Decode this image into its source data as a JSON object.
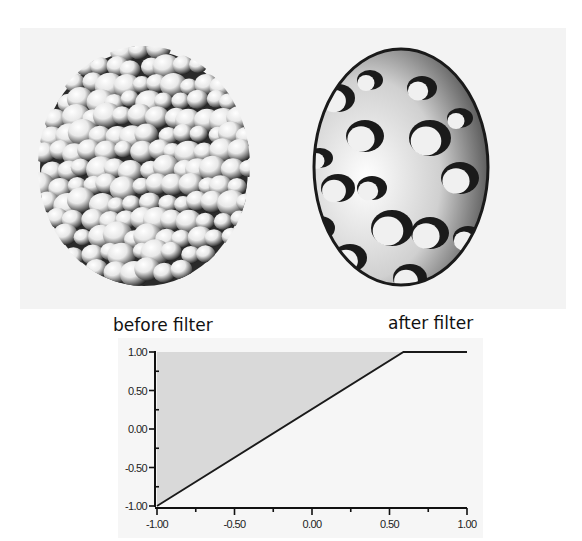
{
  "figure": {
    "left_render": {
      "name": "before-filter-render",
      "description": "clustered blob sphere"
    },
    "right_render": {
      "name": "after-filter-render",
      "description": "smooth cut sphere with blob holes"
    },
    "labels": {
      "before": "before filter",
      "after": "after filter"
    }
  },
  "colors": {
    "panel_bg": "#f3f3f3",
    "chart_bg": "#f6f6f6",
    "fill_region": "#d9d9d9",
    "line": "#1a1a1a",
    "axis": "#111111"
  },
  "chart_data": {
    "type": "area",
    "title": "",
    "xlabel": "",
    "ylabel": "",
    "xlim": [
      -1.0,
      1.0
    ],
    "ylim": [
      -1.0,
      1.0
    ],
    "grid": false,
    "legend": null,
    "x_ticks": [
      "-1.00",
      "-0.50",
      "0.00",
      "0.50",
      "1.00"
    ],
    "y_ticks": [
      "1.00",
      "0.50",
      "0.00",
      "-0.50",
      "-1.00"
    ],
    "series": [
      {
        "name": "transfer function",
        "x": [
          -1.0,
          0.59,
          1.0
        ],
        "y": [
          -1.0,
          1.0,
          1.0
        ]
      }
    ],
    "shaded_region": {
      "description": "area above the transfer line up to y=1.00",
      "polygon": [
        [
          -1.0,
          -1.0
        ],
        [
          -1.0,
          1.0
        ],
        [
          0.59,
          1.0
        ]
      ]
    },
    "annotations": [
      {
        "text": "before filter",
        "position": "top-left"
      },
      {
        "text": "after filter",
        "position": "top-right"
      }
    ]
  }
}
